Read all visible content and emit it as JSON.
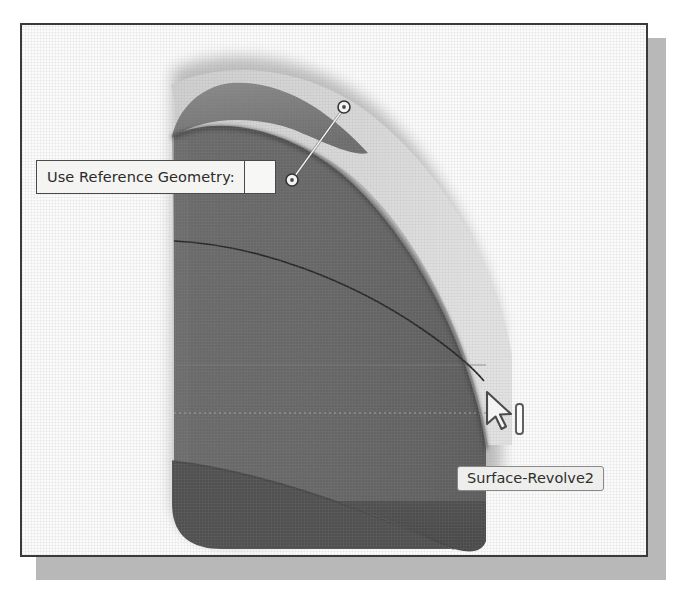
{
  "figure": {
    "kind": "cad-viewport-screenshot",
    "application_hint": "3D CAD modeling viewport",
    "frame_border_color": "#3a3a3a",
    "shadow_color": "#b8b8b8",
    "viewport_background_color": "#fbfbfb"
  },
  "callout": {
    "label": "Use Reference Geometry:",
    "value": "",
    "value_placeholder": "",
    "background_color": "#f4f4f2",
    "border_color": "#4a4a4a",
    "text_color": "#2b2b2b"
  },
  "tooltip": {
    "label": "Surface-Revolve2",
    "background_color": "#eeeeec",
    "border_color": "#8a8a8a",
    "text_color": "#2f2f2f"
  },
  "leader": {
    "marker_start_icon": "circle-handle-icon",
    "marker_end_icon": "circle-handle-icon",
    "line_color": "#efefef",
    "marker_fill": "#f2f2f2",
    "marker_stroke": "#3b3b3b"
  },
  "cursor": {
    "pointer_icon": "mouse-arrow-pointer-icon",
    "beam_icon": "text-beam-icon",
    "fill_color": "#f4f4f4",
    "stroke_color": "#4a4a4a"
  },
  "model": {
    "name": "Surface-Revolve2",
    "surface_fill": "#656565",
    "surface_highlight_fill": "#767676",
    "surface_shadow_fill": "#4e4e4e",
    "band_fill": "#d8d8d8",
    "edge_color": "#2a2a2a",
    "silhouette_color": "#3d3d3d",
    "shadow_blur_color": "#8e8e8e"
  },
  "colors": {
    "paper": "#ffffff",
    "ink": "#2b2b2b"
  }
}
